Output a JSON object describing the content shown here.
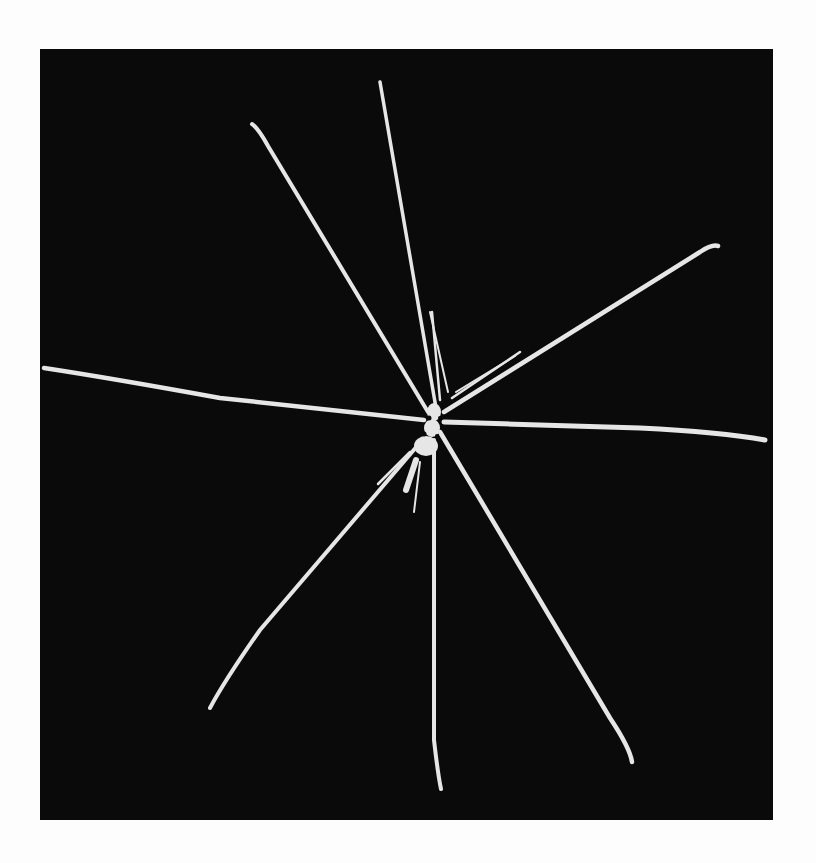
{
  "page": {
    "background": "#fdfdfd"
  },
  "photo": {
    "subject": "sea spider (pycnogonid) specimen",
    "background_color": "#0a0a0a",
    "specimen_color": "#e8e8e8",
    "frame": {
      "x": 40,
      "y": 49,
      "width": 733,
      "height": 771
    },
    "body_center": [
      432,
      420
    ],
    "legs": [
      {
        "name": "leg-upper-left",
        "tip": [
          252,
          122
        ]
      },
      {
        "name": "leg-upper",
        "tip": [
          380,
          82
        ]
      },
      {
        "name": "leg-upper-right",
        "tip": [
          718,
          244
        ]
      },
      {
        "name": "leg-right",
        "tip": [
          765,
          440
        ]
      },
      {
        "name": "leg-lower-right",
        "tip": [
          632,
          762
        ]
      },
      {
        "name": "leg-lower",
        "tip": [
          441,
          789
        ]
      },
      {
        "name": "leg-lower-left",
        "tip": [
          210,
          708
        ]
      },
      {
        "name": "leg-left",
        "tip": [
          44,
          368
        ]
      }
    ]
  }
}
